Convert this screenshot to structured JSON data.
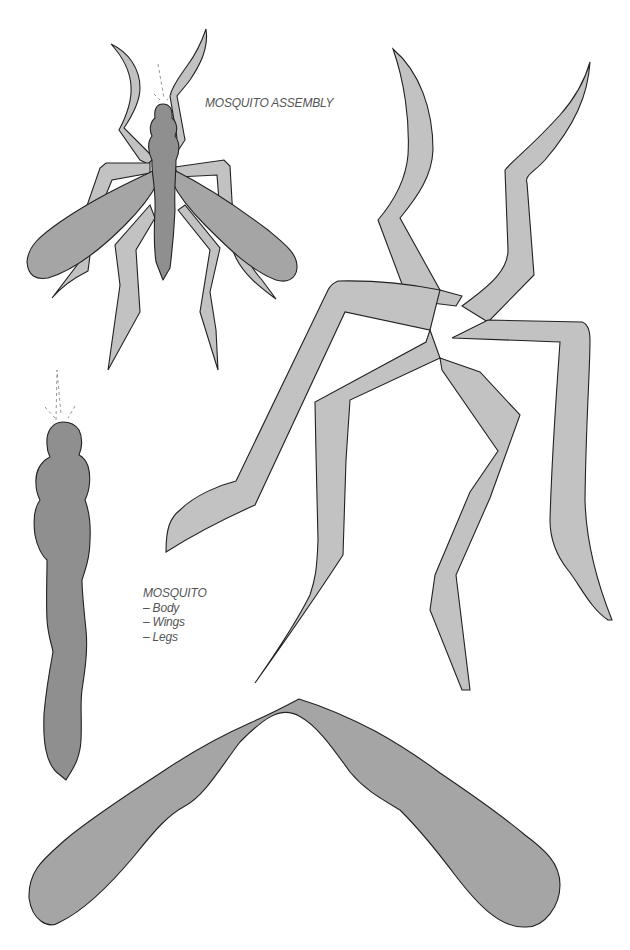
{
  "page": {
    "type": "printable craft template",
    "colors": {
      "background": "#ffffff",
      "body_fill": "#8f8f8f",
      "wing_fill": "#a5a5a5",
      "leg_fill": "#c2c2c2",
      "outline": "#222222",
      "label_text": "#555555"
    }
  },
  "assembly": {
    "title": "MOSQUITO ASSEMBLY"
  },
  "parts": {
    "heading": "MOSQUITO",
    "items": [
      {
        "label": "– Body"
      },
      {
        "label": "– Wings"
      },
      {
        "label": "– Legs"
      }
    ]
  },
  "cutouts": [
    {
      "name": "body",
      "shape": "segmented-body"
    },
    {
      "name": "wings",
      "shape": "chevron-wings"
    },
    {
      "name": "legs",
      "shape": "six-legs"
    }
  ]
}
